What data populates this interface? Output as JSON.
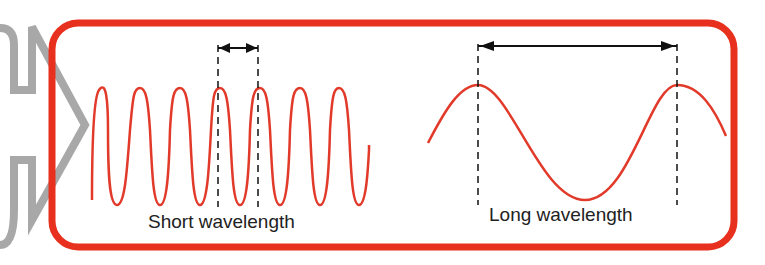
{
  "diagram": {
    "type": "wavelength-comparison",
    "colors": {
      "frame": "#e8301e",
      "wave": "#e23a2a",
      "arrow_connector": "#a8a8a8",
      "annotation": "#111111",
      "text": "#222222"
    },
    "panels": [
      {
        "id": "short",
        "label": "Short wavelength",
        "wave_cycles_visible": 7,
        "wave_shape": "high-frequency sinusoid"
      },
      {
        "id": "long",
        "label": "Long wavelength",
        "wave_cycles_visible": 1.5,
        "wave_shape": "low-frequency sinusoid"
      }
    ],
    "annotations": [
      {
        "type": "double-arrow",
        "marks": "one wavelength",
        "panel": "short"
      },
      {
        "type": "double-arrow",
        "marks": "one wavelength",
        "panel": "long"
      }
    ]
  }
}
